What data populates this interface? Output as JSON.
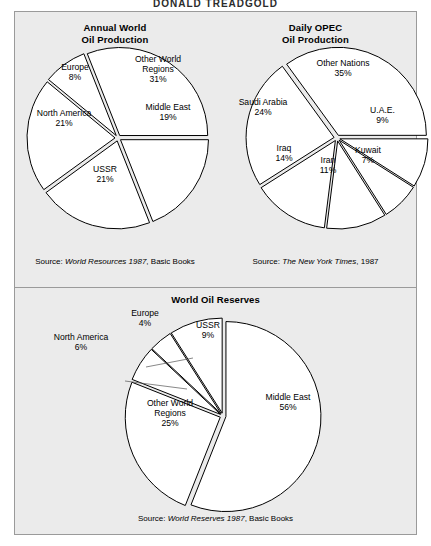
{
  "page": {
    "top_title": "DONALD TREADGOLD",
    "background": "#ebebeb",
    "frame_border": "#9a9a9a"
  },
  "chart_data": [
    {
      "type": "pie",
      "id": "annual-world-oil-production",
      "title": "Annual World\nOil Production",
      "title_line1": "Annual World",
      "title_line2": "Oil Production",
      "source_prefix": "Source:",
      "source_italic": "World Resources 1987",
      "source_rest": ", Basic Books",
      "exploded": true,
      "units": "percent",
      "categories": [
        "Other World Regions",
        "Middle East",
        "USSR",
        "North America",
        "Europe"
      ],
      "values": [
        31,
        19,
        21,
        21,
        8
      ],
      "labels": [
        {
          "name": "Other World Regions",
          "line1": "Other World",
          "line2": "Regions",
          "value": "31%"
        },
        {
          "name": "Middle East",
          "line1": "Middle East",
          "line2": "",
          "value": "19%"
        },
        {
          "name": "USSR",
          "line1": "USSR",
          "line2": "",
          "value": "21%"
        },
        {
          "name": "North America",
          "line1": "North America",
          "line2": "",
          "value": "21%"
        },
        {
          "name": "Europe",
          "line1": "Europe",
          "line2": "",
          "value": "8%"
        }
      ]
    },
    {
      "type": "pie",
      "id": "daily-opec-oil-production",
      "title": "Daily OPEC\nOil Production",
      "title_line1": "Daily OPEC",
      "title_line2": "Oil Production",
      "source_prefix": "Source:",
      "source_italic": "The New York Times",
      "source_rest": ", 1987",
      "exploded": true,
      "units": "percent",
      "categories": [
        "Other Nations",
        "U.A.E.",
        "Kuwait",
        "Iran",
        "Iraq",
        "Saudi Arabia"
      ],
      "values": [
        35,
        9,
        7,
        11,
        14,
        24
      ],
      "labels": [
        {
          "name": "Other Nations",
          "line1": "Other Nations",
          "line2": "",
          "value": "35%"
        },
        {
          "name": "U.A.E.",
          "line1": "U.A.E.",
          "line2": "",
          "value": "9%"
        },
        {
          "name": "Kuwait",
          "line1": "Kuwait",
          "line2": "",
          "value": "7%"
        },
        {
          "name": "Iran",
          "line1": "Iran",
          "line2": "",
          "value": "11%"
        },
        {
          "name": "Iraq",
          "line1": "Iraq",
          "line2": "",
          "value": "14%"
        },
        {
          "name": "Saudi Arabia",
          "line1": "Saudi Arabia",
          "line2": "",
          "value": "24%"
        }
      ]
    },
    {
      "type": "pie",
      "id": "world-oil-reserves",
      "title": "World  Oil Reserves",
      "title_line1": "World  Oil Reserves",
      "title_line2": "",
      "source_prefix": "Source:",
      "source_italic": "World Reserves 1987",
      "source_rest": ", Basic Books",
      "exploded": true,
      "units": "percent",
      "categories": [
        "Middle East",
        "Other World Regions",
        "North America",
        "Europe",
        "USSR"
      ],
      "values": [
        56,
        25,
        6,
        4,
        9
      ],
      "labels": [
        {
          "name": "Middle East",
          "line1": "Middle East",
          "line2": "",
          "value": "56%"
        },
        {
          "name": "Other World Regions",
          "line1": "Other World",
          "line2": "Regions",
          "value": "25%"
        },
        {
          "name": "North America",
          "line1": "North America",
          "line2": "",
          "value": "6%"
        },
        {
          "name": "Europe",
          "line1": "Europe",
          "line2": "",
          "value": "4%"
        },
        {
          "name": "USSR",
          "line1": "USSR",
          "line2": "",
          "value": "9%"
        }
      ]
    }
  ]
}
